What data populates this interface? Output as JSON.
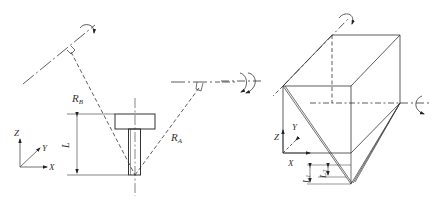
{
  "figure_left": {
    "labels": {
      "rb": "R",
      "rb_sub": "B",
      "ra": "R",
      "ra_sub": "A",
      "length": "L",
      "axis_z": "Z",
      "axis_y": "Y",
      "axis_x": "X"
    }
  },
  "figure_right": {
    "labels": {
      "axis_z": "Z",
      "axis_y": "Y",
      "axis_x": "X",
      "l1": "L",
      "l1_sub": "1",
      "l2": "L",
      "l2_sub": "2"
    }
  },
  "colors": {
    "line": "#333333",
    "background": "#ffffff"
  }
}
